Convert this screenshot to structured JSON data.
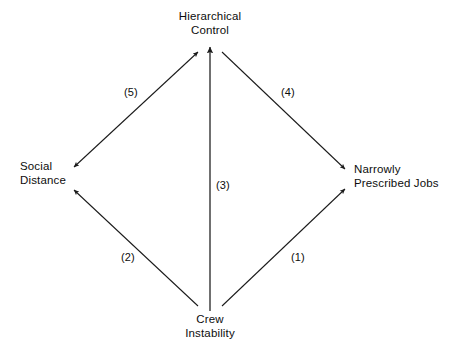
{
  "diagram": {
    "line_color": "#1a1a1a",
    "text_color": "#0d0d0d",
    "background": "#ffffff",
    "nodes": [
      {
        "id": "hierarchical-control",
        "line1": "Hierarchical",
        "line2": "Control",
        "x": 210,
        "y": 22
      },
      {
        "id": "social-distance",
        "line1": "Social",
        "line2": "Distance",
        "x": 40,
        "y": 178
      },
      {
        "id": "narrowly-prescribed-jobs",
        "line1": "Narrowly",
        "line2": "Prescribed Jobs",
        "x": 395,
        "y": 180
      },
      {
        "id": "crew-instability",
        "line1": "Crew",
        "line2": "Instability",
        "x": 210,
        "y": 325
      }
    ],
    "edges": [
      {
        "id": "edge-1",
        "label": "(1)",
        "from": "crew-instability",
        "to": "narrowly-prescribed-jobs",
        "arrows": "single",
        "label_x": 291,
        "label_y": 251
      },
      {
        "id": "edge-2",
        "label": "(2)",
        "from": "crew-instability",
        "to": "social-distance",
        "arrows": "single",
        "label_x": 121,
        "label_y": 251
      },
      {
        "id": "edge-3",
        "label": "(3)",
        "from": "crew-instability",
        "to": "hierarchical-control",
        "arrows": "single",
        "label_x": 216,
        "label_y": 179
      },
      {
        "id": "edge-4",
        "label": "(4)",
        "from": "hierarchical-control",
        "to": "narrowly-prescribed-jobs",
        "arrows": "single",
        "label_x": 281,
        "label_y": 86
      },
      {
        "id": "edge-5",
        "label": "(5)",
        "from": "hierarchical-control",
        "to": "social-distance",
        "arrows": "double",
        "label_x": 124,
        "label_y": 86
      }
    ]
  }
}
